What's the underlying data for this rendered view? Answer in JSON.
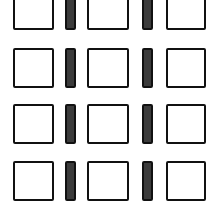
{
  "pattern": {
    "background_color": "#ffffff",
    "square_fill": "#ffffff",
    "bar_fill": "#3b3b3b",
    "outline_color": "#111111",
    "rows": [
      {
        "top": -10,
        "height": 40
      },
      {
        "top": 48,
        "height": 40
      },
      {
        "top": 104,
        "height": 40
      },
      {
        "top": 161,
        "height": 40
      }
    ],
    "columns": [
      {
        "type": "square",
        "left": 13,
        "width": 41
      },
      {
        "type": "bar",
        "left": 65,
        "width": 11
      },
      {
        "type": "square",
        "left": 87,
        "width": 42
      },
      {
        "type": "bar",
        "left": 142,
        "width": 11
      },
      {
        "type": "square",
        "left": 166,
        "width": 40
      }
    ]
  }
}
